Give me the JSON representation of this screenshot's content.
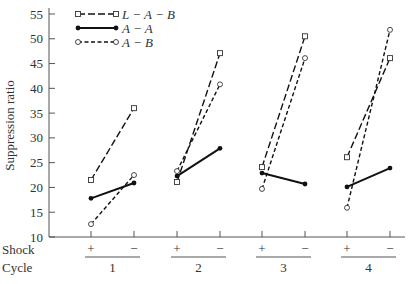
{
  "chart_data": {
    "type": "line",
    "title": "",
    "xlabel": "",
    "ylabel": "Suppression ratio",
    "ylim": [
      10,
      55
    ],
    "yticks": [
      10,
      15,
      20,
      25,
      30,
      35,
      40,
      45,
      50,
      55
    ],
    "grid": false,
    "legend_position": "top-left",
    "x_row_labels": {
      "shock": "Shock",
      "cycle": "Cycle"
    },
    "cycles": [
      "1",
      "2",
      "3",
      "4"
    ],
    "shock_levels": [
      "+",
      "−"
    ],
    "categories": [
      "1+",
      "1−",
      "2+",
      "2−",
      "3+",
      "3−",
      "4+",
      "4−"
    ],
    "series": [
      {
        "name": "L − A − B",
        "style": "long-dash",
        "marker": "open-square",
        "values": [
          21.5,
          36.0,
          21.1,
          47.1,
          24.1,
          50.5,
          26.1,
          46.1
        ]
      },
      {
        "name": "A − A",
        "style": "solid",
        "marker": "filled-circle",
        "values": [
          17.8,
          20.9,
          22.3,
          27.9,
          22.9,
          20.7,
          20.1,
          23.9
        ]
      },
      {
        "name": "A − B",
        "style": "short-dash",
        "marker": "open-circle",
        "values": [
          12.6,
          22.5,
          23.3,
          40.8,
          19.7,
          46.1,
          15.9,
          51.8
        ]
      }
    ]
  }
}
